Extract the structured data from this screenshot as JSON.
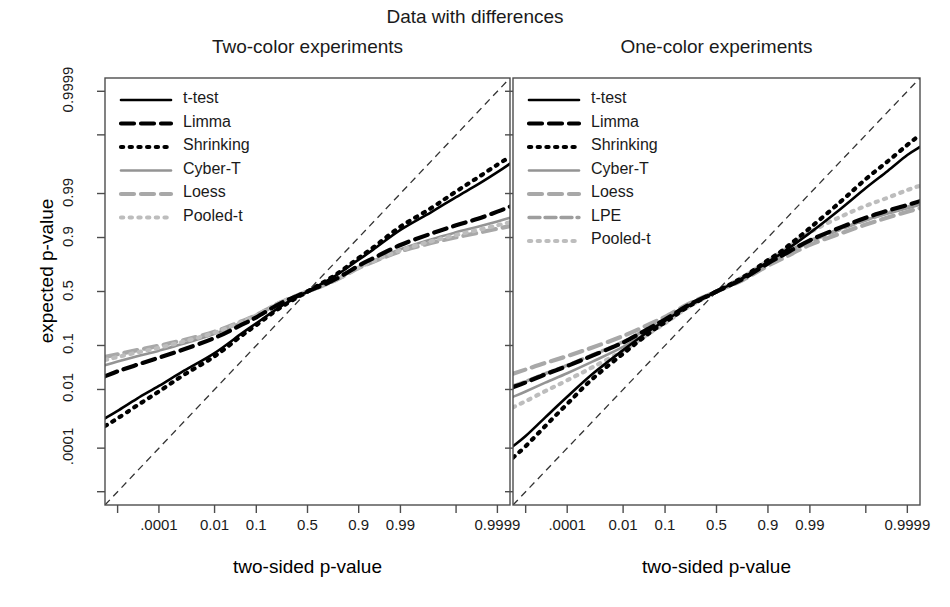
{
  "figure": {
    "main_title": "Data with differences",
    "ylabel": "expected p-value",
    "xlabel_left": "two-sided p-value",
    "xlabel_right": "two-sided p-value"
  },
  "panels": [
    {
      "id": "two-color",
      "subtitle": "Two-color experiments",
      "legend": [
        {
          "label": "t-test",
          "style": "solid",
          "color": "#000000"
        },
        {
          "label": "Limma",
          "style": "dashed",
          "color": "#000000"
        },
        {
          "label": "Shrinking",
          "style": "dotted",
          "color": "#000000"
        },
        {
          "label": "Cyber-T",
          "style": "solid",
          "color": "#949494"
        },
        {
          "label": "Loess",
          "style": "dashed",
          "color": "#a8a8a8"
        },
        {
          "label": "Pooled-t",
          "style": "dotted",
          "color": "#bdbdbd"
        }
      ]
    },
    {
      "id": "one-color",
      "subtitle": "One-color experiments",
      "legend": [
        {
          "label": "t-test",
          "style": "solid",
          "color": "#000000"
        },
        {
          "label": "Limma",
          "style": "dashed",
          "color": "#000000"
        },
        {
          "label": "Shrinking",
          "style": "dotted",
          "color": "#000000"
        },
        {
          "label": "Cyber-T",
          "style": "solid",
          "color": "#949494"
        },
        {
          "label": "Loess",
          "style": "dashed",
          "color": "#a8a8a8"
        },
        {
          "label": "LPE",
          "style": "dashdot",
          "color": "#9e9e9e"
        },
        {
          "label": "Pooled-t",
          "style": "dotted",
          "color": "#bdbdbd"
        }
      ]
    }
  ],
  "chart_data": {
    "type": "line",
    "title": "Data with differences",
    "xlabel": "two-sided p-value",
    "ylabel": "expected p-value",
    "scale": "probit",
    "grid": false,
    "legend_position": "top-left",
    "axis": {
      "x_ticks_p": [
        1e-06,
        0.0001,
        0.01,
        0.1,
        0.5,
        0.9,
        0.99,
        0.9999,
        0.999999
      ],
      "x_tick_labels": [
        "",
        ".0001",
        "0.01",
        "0.1",
        "0.5",
        "0.9",
        "0.99",
        "",
        "0.9999"
      ],
      "y_ticks_p": [
        1e-06,
        0.0001,
        0.01,
        0.1,
        0.5,
        0.9,
        0.99,
        0.9999,
        0.999999
      ],
      "y_tick_labels": [
        "",
        ".0001",
        "0.01",
        "0.1",
        "0.5",
        "0.9",
        "0.99",
        "",
        "0.9999"
      ],
      "xlim_p": [
        2e-07,
        0.9999998
      ],
      "ylim_p": [
        2e-07,
        0.9999998
      ],
      "reference_line": {
        "label": "y = x (identity)",
        "style": "dashed",
        "color": "#333333"
      }
    },
    "panels": [
      {
        "name": "Two-color experiments",
        "x_p": [
          2e-07,
          1e-06,
          1e-05,
          0.0001,
          0.001,
          0.01,
          0.05,
          0.1,
          0.25,
          0.5,
          0.75,
          0.9,
          0.95,
          0.99,
          0.999,
          0.9999,
          0.99999,
          0.999999,
          0.9999998
        ],
        "series": [
          {
            "name": "t-test",
            "style": "solid",
            "color": "#000000",
            "y_p": [
              0.0013,
              0.0023,
              0.0055,
              0.0125,
              0.03,
              0.072,
              0.16,
              0.225,
              0.36,
              0.5,
              0.64,
              0.775,
              0.84,
              0.928,
              0.97,
              0.9875,
              0.9945,
              0.9977,
              0.9988
            ]
          },
          {
            "name": "Limma",
            "style": "dashed",
            "color": "#000000",
            "y_p": [
              0.022,
              0.029,
              0.041,
              0.058,
              0.085,
              0.135,
              0.215,
              0.27,
              0.39,
              0.5,
              0.61,
              0.73,
              0.785,
              0.865,
              0.915,
              0.942,
              0.958,
              0.971,
              0.978
            ]
          },
          {
            "name": "Shrinking",
            "style": "dotted",
            "color": "#000000",
            "y_p": [
              0.0007,
              0.0013,
              0.0034,
              0.0088,
              0.024,
              0.062,
              0.148,
              0.213,
              0.352,
              0.5,
              0.648,
              0.787,
              0.852,
              0.938,
              0.976,
              0.9912,
              0.9966,
              0.9987,
              0.9993
            ]
          },
          {
            "name": "Cyber-T",
            "style": "solid",
            "color": "#949494",
            "y_p": [
              0.04,
              0.048,
              0.062,
              0.08,
              0.108,
              0.158,
              0.232,
              0.283,
              0.397,
              0.5,
              0.603,
              0.717,
              0.768,
              0.842,
              0.892,
              0.92,
              0.938,
              0.952,
              0.96
            ]
          },
          {
            "name": "Loess",
            "style": "dashed",
            "color": "#a8a8a8",
            "y_p": [
              0.06,
              0.068,
              0.082,
              0.099,
              0.125,
              0.17,
              0.24,
              0.288,
              0.398,
              0.5,
              0.602,
              0.712,
              0.76,
              0.83,
              0.875,
              0.901,
              0.918,
              0.932,
              0.94
            ]
          },
          {
            "name": "Pooled-t",
            "style": "dotted",
            "color": "#bdbdbd",
            "y_p": [
              0.052,
              0.06,
              0.074,
              0.091,
              0.118,
              0.164,
              0.236,
              0.286,
              0.398,
              0.5,
              0.602,
              0.714,
              0.764,
              0.836,
              0.883,
              0.91,
              0.928,
              0.942,
              0.95
            ]
          }
        ]
      },
      {
        "name": "One-color experiments",
        "x_p": [
          2e-07,
          1e-06,
          1e-05,
          0.0001,
          0.001,
          0.01,
          0.05,
          0.1,
          0.25,
          0.5,
          0.75,
          0.9,
          0.95,
          0.99,
          0.999,
          0.9999,
          0.99999,
          0.999999,
          0.9999998
        ],
        "series": [
          {
            "name": "t-test",
            "style": "solid",
            "color": "#000000",
            "y_p": [
              0.00012,
              0.0003,
              0.0014,
              0.0062,
              0.025,
              0.082,
              0.18,
              0.243,
              0.372,
              0.5,
              0.63,
              0.76,
              0.822,
              0.918,
              0.975,
              0.993,
              0.9979,
              0.9994,
              0.9997
            ]
          },
          {
            "name": "Limma",
            "style": "dashed",
            "color": "#000000",
            "y_p": [
              0.0115,
              0.0155,
              0.0245,
              0.0385,
              0.064,
              0.113,
              0.196,
              0.253,
              0.378,
              0.5,
              0.622,
              0.748,
              0.805,
              0.888,
              0.936,
              0.96,
              0.9725,
              0.98,
              0.984
            ]
          },
          {
            "name": "Shrinking",
            "style": "dotted",
            "color": "#000000",
            "y_p": [
              4e-05,
              0.00012,
              0.0007,
              0.0038,
              0.019,
              0.07,
              0.167,
              0.232,
              0.365,
              0.5,
              0.636,
              0.772,
              0.836,
              0.934,
              0.9835,
              0.9962,
              0.999,
              0.99975,
              0.9999
            ]
          },
          {
            "name": "Cyber-T",
            "style": "solid",
            "color": "#949494",
            "y_p": [
              0.0062,
              0.0088,
              0.0152,
              0.0262,
              0.048,
              0.094,
              0.177,
              0.236,
              0.368,
              0.5,
              0.632,
              0.757,
              0.812,
              0.888,
              0.932,
              0.955,
              0.968,
              0.976,
              0.9805
            ]
          },
          {
            "name": "Loess",
            "style": "dashed",
            "color": "#a8a8a8",
            "y_p": [
              0.0255,
              0.032,
              0.045,
              0.0625,
              0.092,
              0.145,
              0.222,
              0.274,
              0.388,
              0.5,
              0.612,
              0.73,
              0.783,
              0.866,
              0.916,
              0.944,
              0.9605,
              0.971,
              0.976
            ]
          },
          {
            "name": "LPE",
            "style": "dashdot",
            "color": "#9e9e9e",
            "y_p": [
              0.0125,
              0.0165,
              0.0258,
              0.04,
              0.066,
              0.116,
              0.199,
              0.256,
              0.38,
              0.5,
              0.62,
              0.744,
              0.8,
              0.882,
              0.93,
              0.955,
              0.969,
              0.9775,
              0.982
            ]
          },
          {
            "name": "Pooled-t",
            "style": "dotted",
            "color": "#bdbdbd",
            "y_p": [
              0.003,
              0.0046,
              0.009,
              0.0175,
              0.036,
              0.08,
              0.165,
              0.226,
              0.362,
              0.5,
              0.638,
              0.768,
              0.83,
              0.92,
              0.962,
              0.979,
              0.987,
              0.992,
              0.994
            ]
          }
        ]
      }
    ]
  }
}
